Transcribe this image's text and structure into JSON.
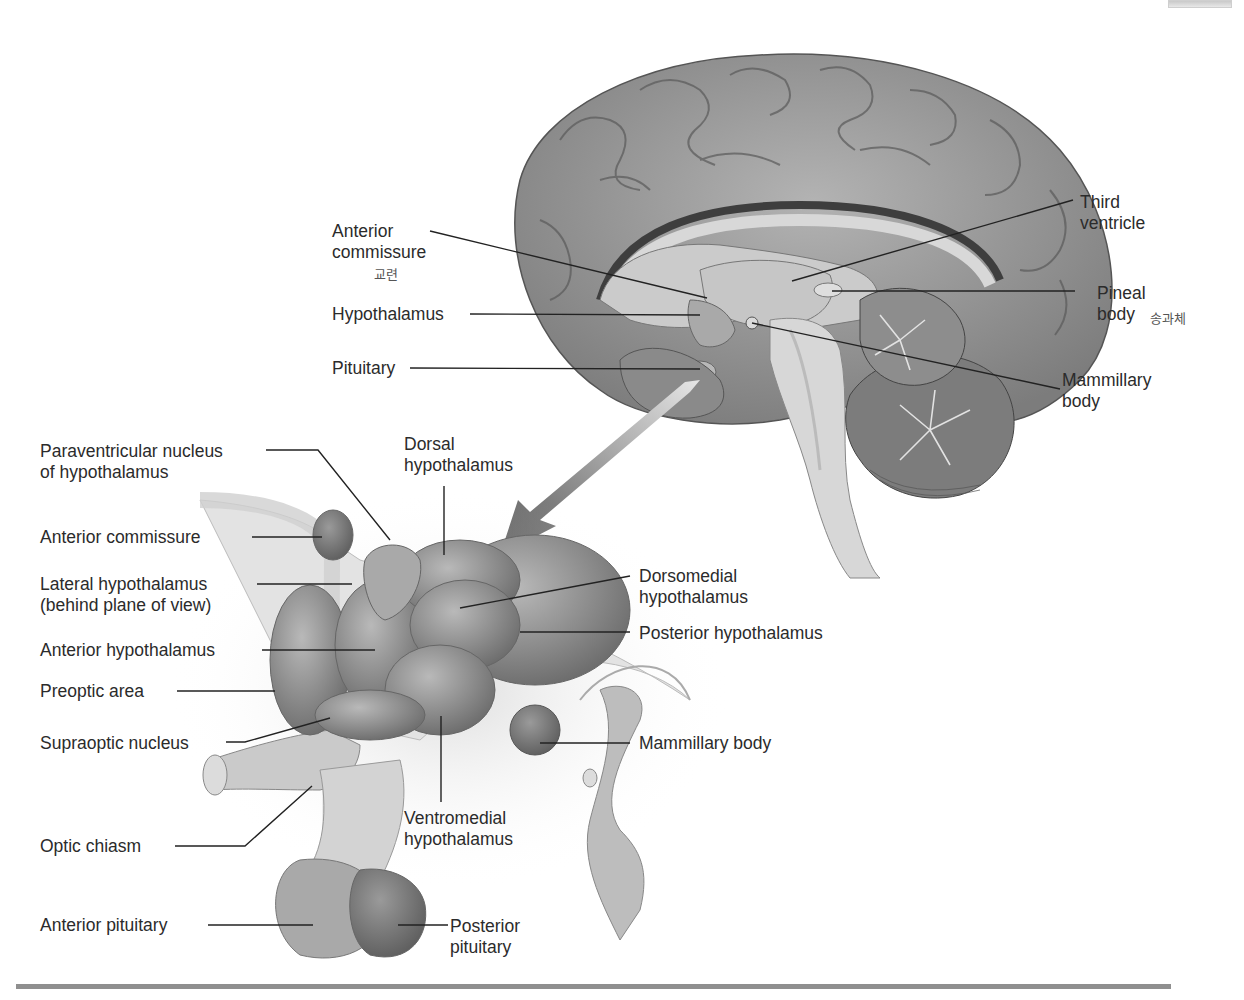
{
  "figure": {
    "brain_labels": {
      "anterior_commissure": [
        "Anterior",
        "commissure"
      ],
      "anterior_commissure_note": "교련",
      "hypothalamus": "Hypothalamus",
      "pituitary": "Pituitary",
      "third_ventricle": [
        "Third",
        "ventricle"
      ],
      "pineal_body": [
        "Pineal",
        "body"
      ],
      "pineal_body_note": "송과체",
      "mammillary_body": [
        "Mammillary",
        "body"
      ]
    },
    "detail_labels": {
      "paraventricular": [
        "Paraventricular nucleus",
        "of hypothalamus"
      ],
      "dorsal": [
        "Dorsal",
        "hypothalamus"
      ],
      "anterior_commissure": "Anterior commissure",
      "lateral": [
        "Lateral hypothalamus",
        "(behind plane of view)"
      ],
      "dorsomedial": [
        "Dorsomedial",
        "hypothalamus"
      ],
      "posterior": "Posterior hypothalamus",
      "anterior": "Anterior hypothalamus",
      "preoptic": "Preoptic area",
      "supraoptic": "Supraoptic nucleus",
      "mammillary": "Mammillary body",
      "ventromedial": [
        "Ventromedial",
        "hypothalamus"
      ],
      "optic_chiasm": "Optic chiasm",
      "anterior_pituitary": "Anterior pituitary",
      "posterior_pituitary": [
        "Posterior",
        "pituitary"
      ]
    },
    "colors": {
      "cortex": "#9a9a9a",
      "cortex_dark": "#6e6e6e",
      "inner_light": "#d4d4d4",
      "nuclei": "#8a8a8a",
      "rule": "#8f8f8f",
      "text": "#2b2b2b"
    }
  }
}
